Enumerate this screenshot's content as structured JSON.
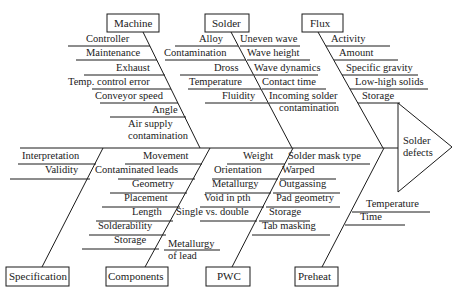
{
  "diagram": {
    "type": "fishbone",
    "effect": {
      "line1": "Solder",
      "line2": "defects"
    },
    "top_categories": [
      {
        "label": "Machine",
        "causes": [
          "Controller",
          "Maintenance",
          "Exhaust",
          "Temp. control error",
          "Conveyor speed",
          "Angle",
          "Air supply",
          "contamination"
        ]
      },
      {
        "label": "Solder",
        "causes": [
          "Alloy",
          "Contamination",
          "Dross",
          "Temperature",
          "Fluidity"
        ],
        "causes_right": [
          "Uneven wave",
          "Wave height",
          "Wave dynamics",
          "Contact time",
          "Incoming solder",
          "contamination"
        ]
      },
      {
        "label": "Flux",
        "causes": [
          "Activity",
          "Amount",
          "Specific gravity",
          "Low-high solids",
          "Storage"
        ]
      }
    ],
    "bottom_categories": [
      {
        "label": "Specification",
        "causes": [
          "Interpretation",
          "Validity"
        ]
      },
      {
        "label": "Components",
        "causes": [
          "Movement",
          "Contaminated leads",
          "Geometry",
          "Placement",
          "Length",
          "Solderability",
          "Storage",
          "Metallurgy",
          "of lead"
        ]
      },
      {
        "label": "PWC",
        "causes": [
          "Weight",
          "Orientation",
          "Metallurgy",
          "Void in pth",
          "Single vs. double"
        ],
        "causes_right": [
          "Solder mask type",
          "Warped",
          "Outgassing",
          "Pad geometry",
          "Storage",
          "Tab masking"
        ]
      },
      {
        "label": "Preheat",
        "causes": [
          "Temperature",
          "Time"
        ]
      }
    ]
  }
}
